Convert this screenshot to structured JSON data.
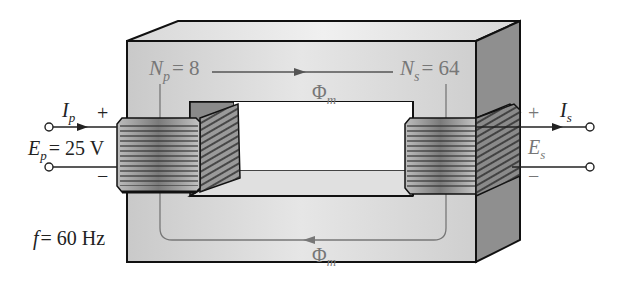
{
  "diagram": {
    "type": "iron-core transformer",
    "primary": {
      "current_label": "I",
      "current_sub": "p",
      "voltage_label": "E",
      "voltage_sub": "p",
      "voltage_value": "= 25 V",
      "turns_label": "N",
      "turns_sub": "p",
      "turns_value": "= 8",
      "plus": "+",
      "minus": "−"
    },
    "secondary": {
      "current_label": "I",
      "current_sub": "s",
      "voltage_label": "E",
      "voltage_sub": "s",
      "turns_label": "N",
      "turns_sub": "s",
      "turns_value": "= 64",
      "plus": "+",
      "minus": "−"
    },
    "flux": {
      "symbol": "Φ",
      "sub": "m"
    },
    "frequency": {
      "label": "f",
      "value": "= 60 Hz"
    },
    "colors": {
      "core_front": "#d4d4d4",
      "core_top": "#e2e2e2",
      "core_side": "#8f8f8f",
      "outline": "#111111",
      "flux_line": "#777777",
      "label_dark": "#222222",
      "label_gray": "#777777"
    }
  }
}
